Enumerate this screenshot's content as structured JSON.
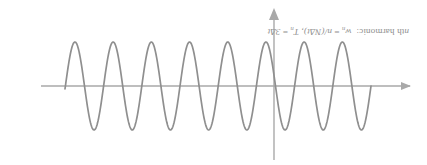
{
  "figure": {
    "orientation": "rotated-180",
    "background_color": "#ffffff",
    "stroke_color": "#8f8f8f",
    "axis_color": "#a8a8a8",
    "caption": {
      "prefix_italic": "n",
      "prefix_rest": "th harmonic:",
      "term1_var": "w",
      "term1_sub": "n",
      "term1_eq": " = ",
      "term1_value": "n/(NΔt),",
      "term2_var": "T",
      "term2_sub": "n",
      "term2_eq": " = ",
      "term2_value": "3Δt",
      "full_text": "nth harmonic:  wₙ = n/(NΔt), Tₙ = 3Δt"
    },
    "horizontal_axis": {
      "name": "time-axis",
      "arrow_direction": "left",
      "y": 79,
      "x_start": 17,
      "x_end": 386
    },
    "vertical_axis": {
      "name": "amplitude-axis",
      "arrow_direction": "down",
      "x": 153,
      "y_start": 5,
      "y_end": 155
    }
  },
  "chart_data": {
    "type": "line",
    "title": "",
    "xlabel": "",
    "ylabel": "",
    "series": [
      {
        "name": "nth harmonic sinusoid",
        "waveform": "sine",
        "amplitude_px": 44,
        "period_px": 38.2,
        "phase": "rising-zero-crossing-at-start",
        "x_start_px": 56,
        "x_end_px": 362,
        "baseline_y_px": 79,
        "cycles": 8,
        "peak_x_px": [
          66,
          104,
          143,
          181,
          219,
          257,
          296,
          334
        ],
        "peak_y_px": 35,
        "trough_x_px": [
          85,
          123,
          162,
          200,
          238,
          276,
          315,
          353
        ],
        "trough_y_px": 123
      }
    ],
    "annotations": [
      "nth harmonic:  wₙ = n/(NΔt), Tₙ = 3Δt"
    ],
    "grid": false,
    "legend": "none"
  }
}
